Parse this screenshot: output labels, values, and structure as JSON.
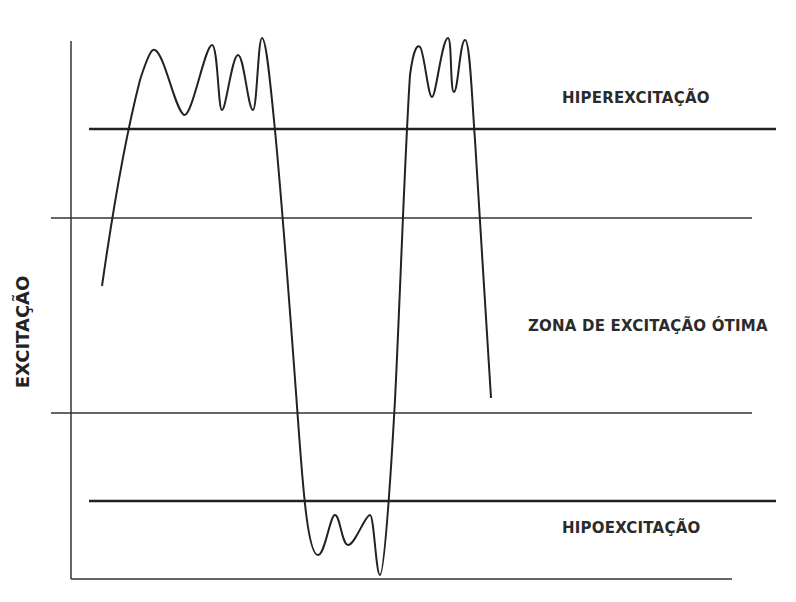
{
  "diagram": {
    "y_axis_label": "EXCITAÇÃO",
    "zones": [
      {
        "id": "hyper",
        "label": "HIPEREXCITAÇÃO"
      },
      {
        "id": "optimal",
        "label": "ZONA DE EXCITAÇÃO ÓTIMA"
      },
      {
        "id": "hypo",
        "label": "HIPOEXCITAÇÃO"
      }
    ],
    "colors": {
      "line": "#222222",
      "text": "#2b2b2b",
      "background": "#ffffff"
    }
  }
}
